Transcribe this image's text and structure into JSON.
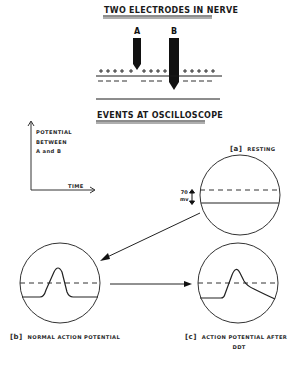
{
  "top_section": {
    "title": "TWO ELECTRODES IN NERVE",
    "electrode_a": "A",
    "electrode_b": "B",
    "membrane_outside_charge": "+",
    "membrane_inside_charge": "−"
  },
  "events_section": {
    "title": "EVENTS AT OSCILLOSCOPE"
  },
  "axes_key": {
    "y_label_line1": "POTENTIAL",
    "y_label_line2": "BETWEEN",
    "y_label_line3": "A and B",
    "x_label": "TIME"
  },
  "panels": [
    {
      "key": "[a]",
      "caption": "RESTING",
      "trace": "flat"
    },
    {
      "key": "[b]",
      "caption": "NORMAL ACTION POTENTIAL",
      "trace": "spike"
    },
    {
      "key": "[c]",
      "caption_line1": "ACTION POTENTIAL AFTER",
      "caption_line2": "DDT",
      "trace": "spike-with-prolonged-afterpotential"
    }
  ],
  "scale_marker": {
    "value": "70",
    "unit": "mv"
  },
  "colors": {
    "ink": "#1a1a1a",
    "background": "#ffffff"
  }
}
